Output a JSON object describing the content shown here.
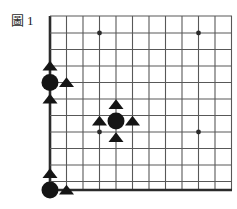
{
  "figure": {
    "label_char": "圖",
    "label_number": "1",
    "full_label": "圖 1"
  },
  "colors": {
    "background": "#ffffff",
    "grid_line": "#585858",
    "border_line": "#2b2b2b",
    "stone_black": "#151515",
    "marker_triangle": "#151515",
    "star_point": "#2b2b2b",
    "label_text": "#1a1a1a"
  },
  "board": {
    "kind": "go-board-corner-diagram",
    "description": "Go board lower-left corner diagram with black stones and triangle markers",
    "grid_spacing": 16.5,
    "origin_x": 50,
    "origin_y": 190,
    "columns": 11,
    "rows": 11,
    "left_edge_x": 50,
    "bottom_edge_y": 190,
    "top_cut_y": 16,
    "right_cut_x": 232,
    "vertical_lines_x": [
      50,
      66.5,
      83,
      99.5,
      116,
      132.5,
      149,
      165.5,
      182,
      198.5,
      215,
      231.5
    ],
    "horizontal_lines_y": [
      16,
      33,
      49.5,
      66,
      82.5,
      99,
      115.5,
      132,
      148.5,
      165,
      181.5,
      190
    ],
    "edge_line_width": 2.6,
    "inner_line_width": 1.1,
    "star_points": [
      {
        "x": 99.5,
        "y": 33,
        "r": 2.4
      },
      {
        "x": 198.5,
        "y": 33,
        "r": 2.4
      },
      {
        "x": 99.5,
        "y": 132,
        "r": 2.4
      },
      {
        "x": 198.5,
        "y": 132,
        "r": 2.4
      }
    ],
    "stones": [
      {
        "id": "stone-left-upper",
        "color": "black",
        "x": 50,
        "y": 82.5,
        "r": 8.5
      },
      {
        "id": "stone-center",
        "color": "black",
        "x": 116,
        "y": 121,
        "r": 8.5
      },
      {
        "id": "stone-bottom-left",
        "color": "black",
        "x": 50,
        "y": 190,
        "r": 8.5
      }
    ],
    "triangles": [
      {
        "id": "triangle-left-above",
        "x": 50,
        "y": 66,
        "size": 7.5
      },
      {
        "id": "triangle-left-right",
        "x": 66.5,
        "y": 82.5,
        "size": 7.5
      },
      {
        "id": "triangle-left-below",
        "x": 50,
        "y": 99,
        "size": 7.5
      },
      {
        "id": "triangle-center-above",
        "x": 116,
        "y": 104.5,
        "size": 7.5
      },
      {
        "id": "triangle-center-left",
        "x": 99.5,
        "y": 121,
        "size": 7.5
      },
      {
        "id": "triangle-center-right",
        "x": 132.5,
        "y": 121,
        "size": 7.5
      },
      {
        "id": "triangle-center-below",
        "x": 116,
        "y": 137.5,
        "size": 7.5
      },
      {
        "id": "triangle-bottom-above",
        "x": 50,
        "y": 173.5,
        "size": 7.5
      },
      {
        "id": "triangle-bottom-right",
        "x": 66.5,
        "y": 190,
        "size": 7.5
      }
    ]
  }
}
